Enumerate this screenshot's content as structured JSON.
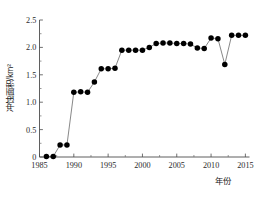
{
  "figure": {
    "caption_partial": ""
  },
  "axes": {
    "y_title": "冲蚀面积/km²",
    "x_title": "年份",
    "y_ticks": [
      "0",
      "0.5",
      "1.0",
      "1.5",
      "2.0",
      "2.5"
    ],
    "x_ticks": [
      "1985",
      "1990",
      "1995",
      "2000",
      "2005",
      "2010",
      "2015"
    ]
  },
  "chart_data": {
    "type": "scatter",
    "title": "",
    "xlabel": "年份",
    "ylabel": "冲蚀面积/km²",
    "xlim": [
      1985,
      2015.6
    ],
    "ylim": [
      0,
      2.5
    ],
    "grid": false,
    "legend": "none",
    "marker": "filled-circle",
    "line_connected": true,
    "x": [
      1986,
      1987,
      1988,
      1989,
      1990,
      1991,
      1992,
      1993,
      1994,
      1995,
      1996,
      1997,
      1998,
      1999,
      2000,
      2001,
      2002,
      2003,
      2004,
      2005,
      2006,
      2007,
      2008,
      2009,
      2010,
      2011,
      2012,
      2013,
      2014,
      2015
    ],
    "y": [
      0.01,
      0.01,
      0.22,
      0.22,
      1.18,
      1.19,
      1.18,
      1.37,
      1.61,
      1.61,
      1.62,
      1.95,
      1.95,
      1.95,
      1.95,
      2.0,
      2.07,
      2.08,
      2.08,
      2.07,
      2.07,
      2.06,
      1.99,
      1.98,
      2.17,
      2.16,
      1.69,
      2.22,
      2.22,
      2.22
    ],
    "categories": [
      "1986",
      "1987",
      "1988",
      "1989",
      "1990",
      "1991",
      "1992",
      "1993",
      "1994",
      "1995",
      "1996",
      "1997",
      "1998",
      "1999",
      "2000",
      "2001",
      "2002",
      "2003",
      "2004",
      "2005",
      "2006",
      "2007",
      "2008",
      "2009",
      "2010",
      "2011",
      "2012",
      "2013",
      "2014",
      "2015"
    ],
    "values": [
      0.01,
      0.01,
      0.22,
      0.22,
      1.18,
      1.19,
      1.18,
      1.37,
      1.61,
      1.61,
      1.62,
      1.95,
      1.95,
      1.95,
      1.95,
      2.0,
      2.07,
      2.08,
      2.08,
      2.07,
      2.07,
      2.06,
      1.99,
      1.98,
      2.17,
      2.16,
      1.69,
      2.22,
      2.22,
      2.22
    ],
    "y_minor_ticks": [
      0.25,
      0.75,
      1.25,
      1.75,
      2.25
    ],
    "x_minor_ticks": [
      1987.5,
      1992.5,
      1997.5,
      2002.5,
      2007.5,
      2012.5
    ],
    "annotations": []
  }
}
